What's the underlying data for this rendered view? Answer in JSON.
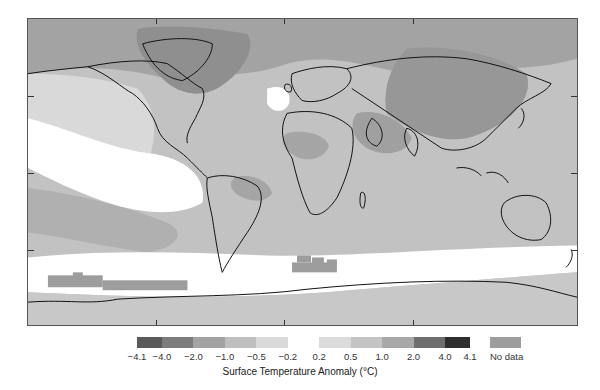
{
  "chart_data": {
    "type": "heatmap",
    "title": "",
    "subtitle": "Global map of surface temperature anomaly",
    "colorbar_label": "Surface Temperature Anomaly (°C)",
    "bins": [
      {
        "from": -4.1,
        "to": -4.0,
        "color": "#5a5a5a"
      },
      {
        "from": -4.0,
        "to": -2.0,
        "color": "#7c7c7c"
      },
      {
        "from": -2.0,
        "to": -1.0,
        "color": "#a3a3a3"
      },
      {
        "from": -1.0,
        "to": -0.5,
        "color": "#bfbfbf"
      },
      {
        "from": -0.5,
        "to": -0.2,
        "color": "#dadada"
      },
      {
        "from": -0.2,
        "to": 0.2,
        "color": "#ffffff"
      },
      {
        "from": 0.2,
        "to": 0.5,
        "color": "#dcdcdc"
      },
      {
        "from": 0.5,
        "to": 1.0,
        "color": "#c4c4c4"
      },
      {
        "from": 1.0,
        "to": 2.0,
        "color": "#a8a8a8"
      },
      {
        "from": 2.0,
        "to": 4.0,
        "color": "#6e6e6e"
      },
      {
        "from": 4.0,
        "to": 4.1,
        "color": "#2e2e2e"
      }
    ],
    "tick_labels": [
      "-4.1",
      "-4.0",
      "-2.0",
      "-1.0",
      "-0.5",
      "-0.2",
      "0.2",
      "0.5",
      "1.0",
      "2.0",
      "4.0",
      "4.1"
    ],
    "no_data": {
      "label": "No data",
      "color": "#9d9d9d"
    },
    "regions_described": [
      {
        "region": "Arctic / Greenland / Northern Siberia",
        "level": "moderate-warm (darker grey)"
      },
      {
        "region": "Central Asia / Middle East",
        "level": "warm (darker grey)"
      },
      {
        "region": "Tropical Eastern Pacific",
        "level": "near zero (white)"
      },
      {
        "region": "North Atlantic patch south of Greenland",
        "level": "near zero (white)"
      },
      {
        "region": "Southern Ocean band",
        "level": "near zero (white)"
      },
      {
        "region": "Antarctic coastal strip",
        "level": "no data / warm blocks"
      }
    ],
    "legend_position": "bottom",
    "grid": false
  },
  "legend": {
    "title": "Surface Temperature Anomaly (°C)",
    "no_data_label": "No data"
  },
  "map": {
    "frame_ticks_x": [
      155,
      283,
      412
    ],
    "frame_ticks_y": [
      95,
      172,
      249
    ]
  }
}
